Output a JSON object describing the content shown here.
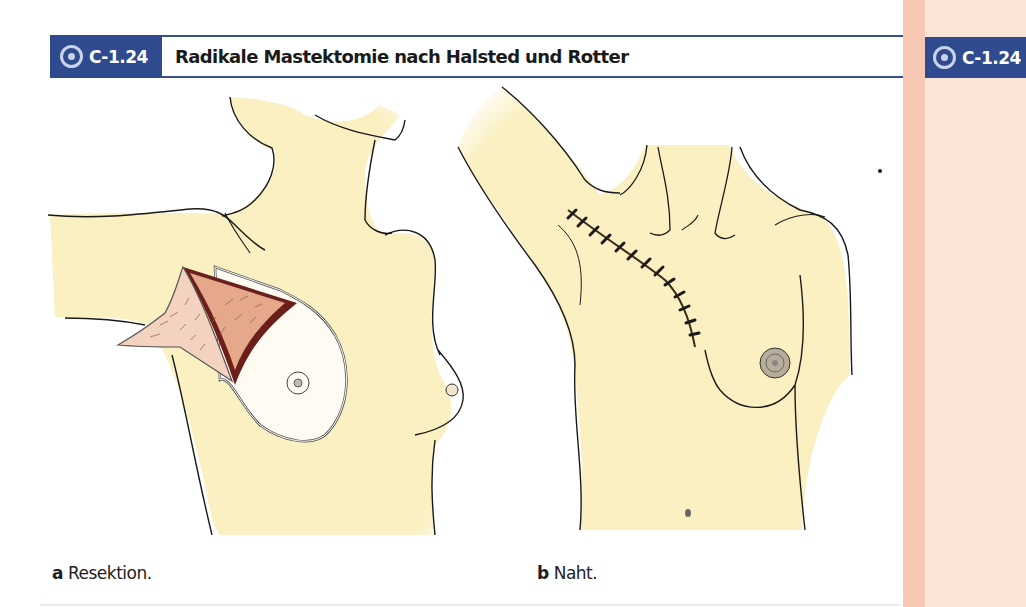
{
  "figure": {
    "number": "C-1.24",
    "title": "Radikale Mastektomie nach Halsted und Rotter",
    "icon": "target-icon"
  },
  "sidebar": {
    "figure_number": "C-1.24",
    "icon": "target-icon"
  },
  "panels": [
    {
      "letter": "a",
      "caption": "Resektion.",
      "illustration": "chest-resection-illustration"
    },
    {
      "letter": "b",
      "caption": "Naht.",
      "illustration": "chest-suture-illustration"
    }
  ],
  "colors": {
    "label_blue": "#2f4a8e",
    "rule_blue": "#3a4f8f",
    "skin": "#fbf0c2",
    "sidebar_pink": "#fbe3d6",
    "sidebar_strip": "#f6c8b4",
    "wound_dark": "#6b1e1a",
    "tissue_pink": "#f2c9b5"
  }
}
